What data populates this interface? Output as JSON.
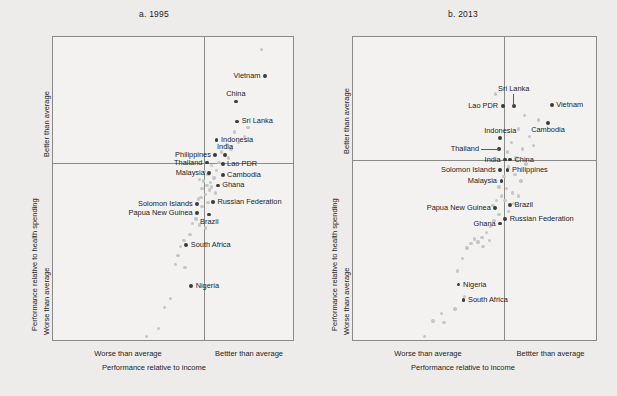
{
  "figure": {
    "background_color": "#edecea",
    "panel_background": "#f3f2f0",
    "frame_color": "#8a8a8a",
    "highlight_color": "#3b3b3b",
    "background_point_color": "#c6c6c6"
  },
  "chart_data": {
    "type": "scatter",
    "title": "",
    "panel_count": 2,
    "xlabel": "Performance relative to income",
    "ylabel": "Performance relative to health spending",
    "x_quadrant_labels": [
      "Worse than average",
      "Bettter than average"
    ],
    "y_quadrant_labels": [
      "Better than average",
      "Worse than average"
    ],
    "xlim": [
      0,
      100
    ],
    "ylim": [
      0,
      100
    ],
    "x_origin": 62,
    "y_origin": 58,
    "grid": false,
    "legend": "none",
    "panels": [
      {
        "key": "a",
        "title": "a. 1995",
        "xlabel": "Performance relative to income",
        "ylabel": "Performance relative to health spending",
        "x_left_label": "Worse than average",
        "x_right_label": "Bettter than average",
        "y_top_label": "Better than average",
        "y_bottom_label": "Worse than average",
        "highlighted": [
          {
            "name": "Vietnam",
            "x": 88.0,
            "y": 87.0,
            "label_side": "left",
            "leader": false
          },
          {
            "name": "China",
            "x": 76.0,
            "y": 78.5,
            "label_side": "above",
            "leader": false
          },
          {
            "name": "Sri Lanka",
            "x": 76.5,
            "y": 72.0,
            "label_side": "right",
            "leader": false
          },
          {
            "name": "Indonesia",
            "x": 68.0,
            "y": 66.0,
            "label_side": "right",
            "leader": false
          },
          {
            "name": "India",
            "x": 71.5,
            "y": 61.0,
            "label_side": "above",
            "leader": false
          },
          {
            "name": "Philippines",
            "x": 67.5,
            "y": 61.0,
            "label_side": "left",
            "leader": false
          },
          {
            "name": "Thailand",
            "x": 64.0,
            "y": 58.5,
            "label_side": "left",
            "leader": false
          },
          {
            "name": "Lao PDR",
            "x": 70.5,
            "y": 58.0,
            "label_side": "right",
            "leader": false
          },
          {
            "name": "Malaysia",
            "x": 65.0,
            "y": 55.0,
            "label_side": "left",
            "leader": false
          },
          {
            "name": "Cambodia",
            "x": 70.5,
            "y": 54.5,
            "label_side": "right",
            "leader": false
          },
          {
            "name": "Ghana",
            "x": 68.5,
            "y": 51.0,
            "label_side": "right",
            "leader": false
          },
          {
            "name": "Russian Federation",
            "x": 66.5,
            "y": 45.5,
            "label_side": "right",
            "leader": false
          },
          {
            "name": "Solomon Islands",
            "x": 60.0,
            "y": 45.0,
            "label_side": "left",
            "leader": false
          },
          {
            "name": "Papua New Guinea",
            "x": 60.0,
            "y": 42.0,
            "label_side": "left",
            "leader": false
          },
          {
            "name": "Brazil",
            "x": 65.0,
            "y": 41.5,
            "label_side": "below",
            "leader": false
          },
          {
            "name": "South Africa",
            "x": 55.5,
            "y": 31.5,
            "label_side": "right",
            "leader": false
          },
          {
            "name": "Nigeria",
            "x": 57.5,
            "y": 18.0,
            "label_side": "right",
            "leader": false
          }
        ],
        "background_points": [
          {
            "x": 86.5,
            "y": 95.5
          },
          {
            "x": 81.0,
            "y": 70.0
          },
          {
            "x": 79.5,
            "y": 67.0
          },
          {
            "x": 77.0,
            "y": 65.0
          },
          {
            "x": 75.5,
            "y": 68.5
          },
          {
            "x": 74.0,
            "y": 63.0
          },
          {
            "x": 73.0,
            "y": 60.0
          },
          {
            "x": 72.0,
            "y": 64.5
          },
          {
            "x": 70.0,
            "y": 62.0
          },
          {
            "x": 69.0,
            "y": 58.5
          },
          {
            "x": 68.0,
            "y": 56.0
          },
          {
            "x": 67.0,
            "y": 53.5
          },
          {
            "x": 66.0,
            "y": 57.5
          },
          {
            "x": 65.5,
            "y": 52.0
          },
          {
            "x": 65.0,
            "y": 49.5
          },
          {
            "x": 64.5,
            "y": 54.5
          },
          {
            "x": 64.0,
            "y": 51.0
          },
          {
            "x": 63.5,
            "y": 48.0
          },
          {
            "x": 63.0,
            "y": 55.5
          },
          {
            "x": 62.5,
            "y": 52.5
          },
          {
            "x": 62.0,
            "y": 50.0
          },
          {
            "x": 61.5,
            "y": 47.0
          },
          {
            "x": 61.0,
            "y": 53.0
          },
          {
            "x": 66.0,
            "y": 50.5
          },
          {
            "x": 67.5,
            "y": 48.5
          },
          {
            "x": 62.0,
            "y": 44.0
          },
          {
            "x": 59.5,
            "y": 40.0
          },
          {
            "x": 58.0,
            "y": 38.5
          },
          {
            "x": 61.0,
            "y": 38.0
          },
          {
            "x": 63.5,
            "y": 37.0
          },
          {
            "x": 57.0,
            "y": 35.0
          },
          {
            "x": 54.5,
            "y": 33.0
          },
          {
            "x": 53.0,
            "y": 31.0
          },
          {
            "x": 52.0,
            "y": 28.0
          },
          {
            "x": 51.0,
            "y": 25.0
          },
          {
            "x": 55.0,
            "y": 24.0
          },
          {
            "x": 49.0,
            "y": 14.0
          },
          {
            "x": 46.5,
            "y": 11.0
          },
          {
            "x": 44.0,
            "y": 4.0
          },
          {
            "x": 39.0,
            "y": 1.5
          },
          {
            "x": 60.5,
            "y": 46.5
          },
          {
            "x": 64.5,
            "y": 45.5
          }
        ]
      },
      {
        "key": "b",
        "title": "b. 2013",
        "xlabel": "Performance relative to income",
        "ylabel": "Performance relative to health spending",
        "x_left_label": "Worse than average",
        "x_right_label": "Bettter than average",
        "y_top_label": "Better than average",
        "y_bottom_label": "Worse than average",
        "highlighted": [
          {
            "name": "Sri Lanka",
            "x": 66.0,
            "y": 77.0,
            "label_side": "above",
            "leader": true
          },
          {
            "name": "Vietnam",
            "x": 81.5,
            "y": 77.5,
            "label_side": "right",
            "leader": false
          },
          {
            "name": "Lao PDR",
            "x": 61.5,
            "y": 77.0,
            "label_side": "left",
            "leader": false
          },
          {
            "name": "Cambodia",
            "x": 80.0,
            "y": 71.5,
            "label_side": "below",
            "leader": false
          },
          {
            "name": "Indonesia",
            "x": 60.5,
            "y": 66.5,
            "label_side": "above",
            "leader": false
          },
          {
            "name": "Thailand",
            "x": 60.0,
            "y": 63.0,
            "label_side": "left",
            "leader": true
          },
          {
            "name": "India",
            "x": 62.5,
            "y": 59.5,
            "label_side": "left",
            "leader": false
          },
          {
            "name": "China",
            "x": 64.5,
            "y": 59.5,
            "label_side": "right",
            "leader": false
          },
          {
            "name": "Solomon Islands",
            "x": 60.5,
            "y": 56.0,
            "label_side": "left",
            "leader": false
          },
          {
            "name": "Philippines",
            "x": 63.5,
            "y": 56.0,
            "label_side": "right",
            "leader": false
          },
          {
            "name": "Malaysia",
            "x": 61.0,
            "y": 52.5,
            "label_side": "left",
            "leader": false
          },
          {
            "name": "Brazil",
            "x": 64.5,
            "y": 44.5,
            "label_side": "right",
            "leader": false
          },
          {
            "name": "Papua New Guinea",
            "x": 58.5,
            "y": 43.5,
            "label_side": "left",
            "leader": false
          },
          {
            "name": "Russian Federation",
            "x": 62.5,
            "y": 40.0,
            "label_side": "right",
            "leader": false
          },
          {
            "name": "Ghana",
            "x": 60.5,
            "y": 38.5,
            "label_side": "left",
            "leader": false
          },
          {
            "name": "Nigeria",
            "x": 43.5,
            "y": 18.5,
            "label_side": "right",
            "leader": false
          },
          {
            "name": "South Africa",
            "x": 45.5,
            "y": 13.5,
            "label_side": "right",
            "leader": false
          }
        ],
        "background_points": [
          {
            "x": 58.5,
            "y": 81.0
          },
          {
            "x": 70.5,
            "y": 74.0
          },
          {
            "x": 76.0,
            "y": 72.5
          },
          {
            "x": 68.0,
            "y": 69.5
          },
          {
            "x": 72.5,
            "y": 67.0
          },
          {
            "x": 65.0,
            "y": 65.0
          },
          {
            "x": 69.5,
            "y": 63.0
          },
          {
            "x": 74.0,
            "y": 64.0
          },
          {
            "x": 63.5,
            "y": 62.0
          },
          {
            "x": 67.0,
            "y": 60.0
          },
          {
            "x": 71.0,
            "y": 58.0
          },
          {
            "x": 64.0,
            "y": 57.0
          },
          {
            "x": 66.5,
            "y": 54.5
          },
          {
            "x": 69.0,
            "y": 52.5
          },
          {
            "x": 62.0,
            "y": 54.0
          },
          {
            "x": 60.0,
            "y": 50.5
          },
          {
            "x": 63.0,
            "y": 50.0
          },
          {
            "x": 65.5,
            "y": 48.5
          },
          {
            "x": 68.0,
            "y": 47.5
          },
          {
            "x": 61.0,
            "y": 47.5
          },
          {
            "x": 59.0,
            "y": 46.0
          },
          {
            "x": 62.5,
            "y": 46.0
          },
          {
            "x": 66.0,
            "y": 45.0
          },
          {
            "x": 57.5,
            "y": 44.5
          },
          {
            "x": 64.0,
            "y": 42.5
          },
          {
            "x": 60.0,
            "y": 41.5
          },
          {
            "x": 58.0,
            "y": 39.5
          },
          {
            "x": 56.5,
            "y": 37.5
          },
          {
            "x": 55.0,
            "y": 35.5
          },
          {
            "x": 53.0,
            "y": 34.0
          },
          {
            "x": 51.5,
            "y": 32.5
          },
          {
            "x": 50.0,
            "y": 33.5
          },
          {
            "x": 48.5,
            "y": 32.0
          },
          {
            "x": 47.0,
            "y": 30.5
          },
          {
            "x": 53.5,
            "y": 31.0
          },
          {
            "x": 56.0,
            "y": 33.0
          },
          {
            "x": 45.0,
            "y": 27.0
          },
          {
            "x": 43.0,
            "y": 23.0
          },
          {
            "x": 46.0,
            "y": 14.5
          },
          {
            "x": 42.0,
            "y": 10.5
          },
          {
            "x": 36.5,
            "y": 9.0
          },
          {
            "x": 33.0,
            "y": 6.5
          },
          {
            "x": 37.5,
            "y": 6.0
          },
          {
            "x": 29.5,
            "y": 1.5
          }
        ]
      }
    ]
  }
}
